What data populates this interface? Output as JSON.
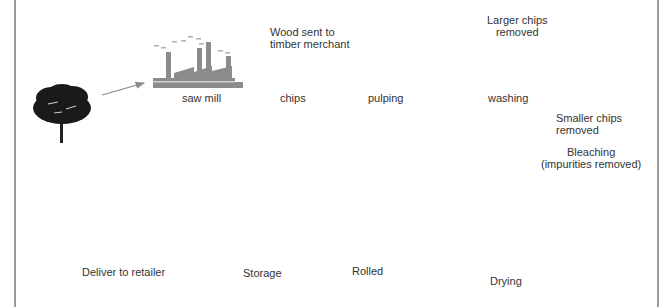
{
  "diagram": {
    "type": "process-flow",
    "stages": [
      {
        "id": "tree",
        "label": ""
      },
      {
        "id": "saw_mill",
        "label": "saw mill"
      },
      {
        "id": "chips",
        "label": "chips"
      },
      {
        "id": "pulping",
        "label": "pulping"
      },
      {
        "id": "washing",
        "label": "washing"
      },
      {
        "id": "bleaching",
        "label": "Bleaching",
        "sublabel": "(impurities removed)"
      },
      {
        "id": "drying",
        "label": "Drying"
      },
      {
        "id": "rolled",
        "label": "Rolled"
      },
      {
        "id": "storage",
        "label": "Storage"
      },
      {
        "id": "deliver",
        "label": "Deliver to retailer"
      }
    ],
    "annotations": {
      "timber": [
        "Wood sent to",
        "timber merchant"
      ],
      "larger_chips": [
        "Larger chips",
        "removed"
      ],
      "smaller_chips": [
        "Smaller chips",
        "removed"
      ]
    },
    "colors": {
      "arrow": "#8a8a8a",
      "machine_gray": "#8c8c8c",
      "dark": "#3a3a3a",
      "frame": "#9a9a9a"
    }
  }
}
